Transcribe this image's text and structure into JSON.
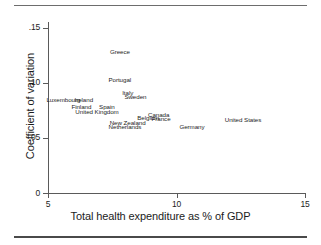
{
  "figure": {
    "has_top_rule": true,
    "has_bottom_rule": true
  },
  "chart_data": {
    "type": "scatter",
    "title": "",
    "xlabel": "Total health expenditure as % of GDP",
    "ylabel": "Coefficient of variation",
    "xlim": [
      5,
      15
    ],
    "ylim": [
      0,
      0.155
    ],
    "grid": false,
    "legend": "none",
    "xticks": [
      "5",
      "10",
      "15"
    ],
    "xtick_values": [
      5,
      10,
      15
    ],
    "yticks": [
      "0",
      ".05",
      ".10",
      ".15"
    ],
    "ytick_values": [
      0,
      0.05,
      0.1,
      0.15
    ],
    "marker_style": "text-label-only",
    "points": [
      {
        "label": "Greece",
        "x": 7.8,
        "y": 0.1285
      },
      {
        "label": "Portugal",
        "x": 7.8,
        "y": 0.1025
      },
      {
        "label": "Italy",
        "x": 8.1,
        "y": 0.0915
      },
      {
        "label": "Sweden",
        "x": 8.4,
        "y": 0.0875
      },
      {
        "label": "Luxembourg",
        "x": 5.6,
        "y": 0.0845
      },
      {
        "label": "Ireland",
        "x": 6.4,
        "y": 0.0845
      },
      {
        "label": "Finland",
        "x": 6.3,
        "y": 0.0785
      },
      {
        "label": "Spain",
        "x": 7.3,
        "y": 0.0785
      },
      {
        "label": "United Kingdom",
        "x": 6.9,
        "y": 0.074
      },
      {
        "label": "Canada",
        "x": 9.3,
        "y": 0.0715
      },
      {
        "label": "Belgium",
        "x": 8.9,
        "y": 0.068
      },
      {
        "label": "France",
        "x": 9.4,
        "y": 0.0675
      },
      {
        "label": "United States",
        "x": 12.6,
        "y": 0.067
      },
      {
        "label": "New Zealand",
        "x": 8.1,
        "y": 0.064
      },
      {
        "label": "Netherlands",
        "x": 8.0,
        "y": 0.0605
      },
      {
        "label": "Germany",
        "x": 10.6,
        "y": 0.06
      }
    ]
  }
}
